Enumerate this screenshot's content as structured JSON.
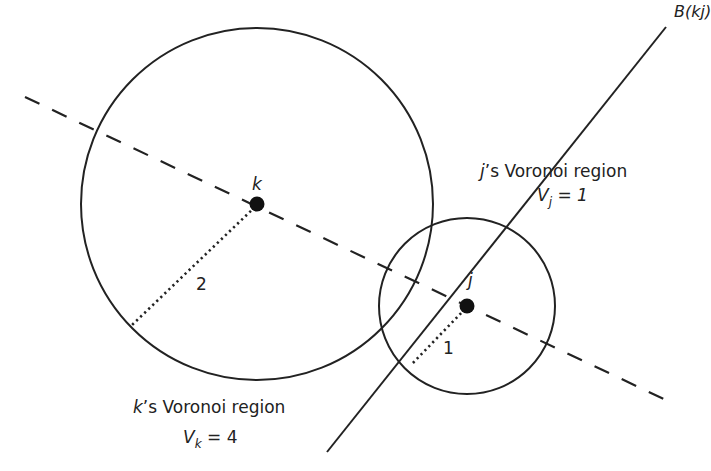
{
  "diagram": {
    "colors": {
      "stroke": "#222222",
      "background": "#ffffff"
    },
    "bisector": {
      "label": "B(kj)"
    },
    "sites": {
      "k": {
        "label": "k",
        "radius_label": "2"
      },
      "j": {
        "label": "j",
        "radius_label": "1"
      }
    },
    "regions": {
      "j": {
        "title_var": "j",
        "title_rest": "’s Voronoi region",
        "volume_var": "V",
        "volume_sub": "j",
        "volume_eq": " = 1"
      },
      "k": {
        "title_var": "k",
        "title_rest": "’s Voronoi region",
        "volume_var": "V",
        "volume_sub": "k",
        "volume_eq": " = 4"
      }
    }
  }
}
